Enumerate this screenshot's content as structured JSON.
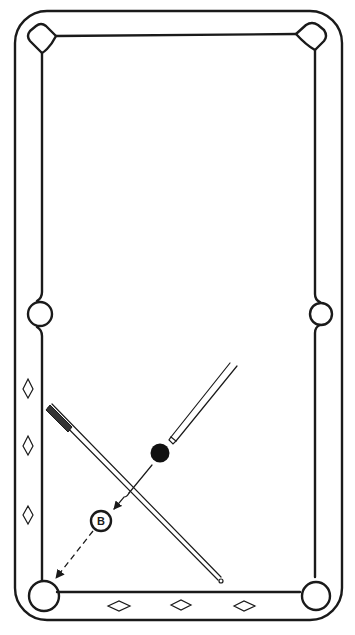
{
  "diagram": {
    "type": "billiards-table-diagram",
    "colors": {
      "line": "#1a1a1a",
      "background": "#ffffff",
      "ball": "#111111"
    },
    "table": {
      "pockets": [
        "top-left",
        "top-right",
        "left-side",
        "right-side",
        "bottom-left",
        "bottom-right"
      ],
      "diamonds": {
        "left_rail_count": 3,
        "bottom_rail_count": 3
      }
    },
    "balls": [
      {
        "name": "object-ball",
        "fill": "#111111",
        "label": ""
      },
      {
        "name": "ghost-ball-B",
        "fill": "#ffffff",
        "label": "B"
      }
    ],
    "cues": [
      {
        "name": "aiming-cue",
        "description": "short cue pointing at object ball from upper right"
      },
      {
        "name": "long-cue",
        "description": "full cue crossing the path, butt at upper left, tip at lower right"
      }
    ],
    "paths": [
      {
        "name": "object-ball-path",
        "style": "solid-arrow",
        "from": "object-ball",
        "to": "ghost-ball-B"
      },
      {
        "name": "b-to-pocket-path",
        "style": "dashed-arrow",
        "from": "ghost-ball-B",
        "to": "bottom-left-pocket"
      }
    ],
    "labels": {
      "ghost_ball": "B"
    }
  }
}
